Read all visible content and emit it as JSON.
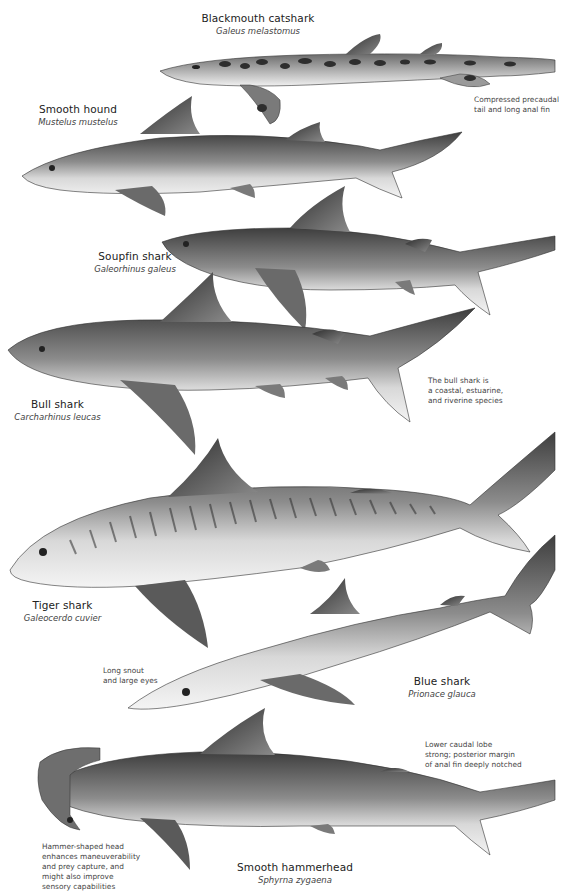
{
  "plate": {
    "background": "#ffffff",
    "species": [
      {
        "id": "blackmouth-catshark",
        "common": "Blackmouth catshark",
        "scientific": "Galeus melastomus",
        "note": "Compressed precaudal\ntail and long anal fin"
      },
      {
        "id": "smooth-hound",
        "common": "Smooth hound",
        "scientific": "Mustelus mustelus",
        "note": ""
      },
      {
        "id": "soupfin-shark",
        "common": "Soupfin shark",
        "scientific": "Galeorhinus galeus",
        "note": ""
      },
      {
        "id": "bull-shark",
        "common": "Bull shark",
        "scientific": "Carcharhinus leucas",
        "note": "The bull shark is\na coastal, estuarine,\nand riverine species"
      },
      {
        "id": "tiger-shark",
        "common": "Tiger shark",
        "scientific": "Galeocerdo cuvier",
        "note": ""
      },
      {
        "id": "blue-shark",
        "common": "Blue shark",
        "scientific": "Prionace glauca",
        "note": "Long snout\nand large eyes"
      },
      {
        "id": "smooth-hammerhead",
        "common": "Smooth hammerhead",
        "scientific": "Sphyrna zygaena",
        "note": "Hammer-shaped head\nenhances maneuverability\nand prey capture, and\nmight also improve\nsensory capabilities"
      }
    ],
    "extra_notes": {
      "hammerhead_caudal": "Lower caudal lobe\nstrong; posterior margin\nof anal fin deeply notched"
    },
    "colors": {
      "text": "#222222",
      "note_text": "#444444",
      "body_dark": "#4a4a4a",
      "body_mid": "#8a8a8a",
      "belly": "#f2f2f2"
    }
  }
}
